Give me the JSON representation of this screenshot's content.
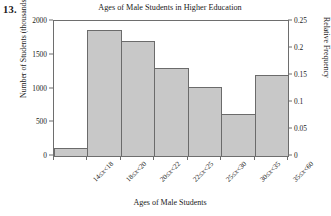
{
  "figure": {
    "number_label": "13."
  },
  "chart_data": {
    "type": "bar",
    "title": "Ages of Male Students in Higher Education",
    "xlabel": "Ages of Male Students",
    "ylabel": "Number of Students (thousands)",
    "ylabel_secondary": "Relative Frequency",
    "categories": [
      "14≤x<18",
      "18≤x<20",
      "20≤x<22",
      "22≤x<25",
      "25≤x<30",
      "30≤x<35",
      "35≤x<60"
    ],
    "values": [
      120,
      1870,
      1700,
      1310,
      1020,
      620,
      1200
    ],
    "values_secondary": [
      0.015,
      0.234,
      0.213,
      0.164,
      0.128,
      0.078,
      0.15
    ],
    "ylim": [
      0,
      2000
    ],
    "ylim_secondary": [
      0,
      0.25
    ],
    "yticks": [
      "0",
      "500",
      "1000",
      "1500",
      "2000"
    ],
    "ytick_values": [
      0,
      500,
      1000,
      1500,
      2000
    ],
    "yticks_secondary": [
      "0",
      "0.05",
      "0.1",
      "0.15",
      "0.2",
      "0.25"
    ],
    "ytick_values_secondary": [
      0,
      0.05,
      0.1,
      0.15,
      0.2,
      0.25
    ],
    "grid": false,
    "legend": "none",
    "bar_fill_color": "#c8c8c8",
    "bar_border_color": "#6b6b6b",
    "axis_color": "#6e6e6e"
  }
}
